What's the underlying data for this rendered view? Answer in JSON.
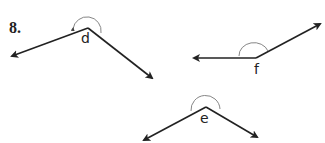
{
  "problem": {
    "number": "8."
  },
  "figures": [
    {
      "label": "d",
      "vertex": [
        88,
        28
      ],
      "ray_a": [
        11,
        56
      ],
      "ray_b": [
        154,
        80
      ],
      "label_pos": [
        80,
        30
      ]
    },
    {
      "label": "f",
      "vertex": [
        256,
        58
      ],
      "ray_a": [
        193,
        58
      ],
      "ray_b": [
        321,
        23
      ],
      "label_pos": [
        256,
        61
      ]
    },
    {
      "label": "e",
      "vertex": [
        206,
        107
      ],
      "ray_a": [
        143,
        140
      ],
      "ray_b": [
        258,
        138
      ],
      "label_pos": [
        201,
        110
      ]
    }
  ],
  "colors": {
    "ray": "#222222",
    "arc": "#666666"
  }
}
